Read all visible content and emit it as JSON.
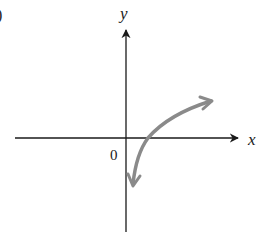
{
  "figure": {
    "part_label_fragment": ")",
    "axes": {
      "x_label": "x",
      "y_label": "y",
      "origin_label": "0"
    },
    "curve": {
      "description": "logarithmic-shaped curve crossing x-axis right of origin, approaching -infinity near y-axis and increasing slowly to the right",
      "color": "#8a8a8a"
    },
    "colors": {
      "axis": "#1a1a1a",
      "curve": "#8a8a8a",
      "background": "#ffffff"
    }
  }
}
